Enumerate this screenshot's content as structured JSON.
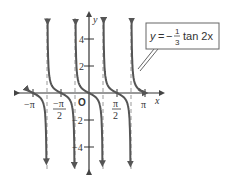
{
  "chart_data": {
    "type": "line",
    "title": "",
    "function_label": {
      "y": "y",
      "eq": "=",
      "minus": "−",
      "num": "1",
      "den": "3",
      "rest": "tan 2x"
    },
    "xlabel": "x",
    "ylabel": "y",
    "origin_label": "O",
    "x_ticks": [
      {
        "value": -3.1416,
        "label": "−π"
      },
      {
        "value": -1.5708,
        "label": "−π/2",
        "num": "−π",
        "den": "2"
      },
      {
        "value": 1.5708,
        "label": "π/2",
        "num": "π",
        "den": "2"
      },
      {
        "value": 3.1416,
        "label": "π"
      }
    ],
    "y_ticks": [
      {
        "value": 4,
        "label": "4"
      },
      {
        "value": 2,
        "label": "2"
      },
      {
        "value": -2,
        "label": "−2"
      },
      {
        "value": -4,
        "label": "−4"
      }
    ],
    "asymptotes": [
      -2.356,
      -0.785,
      0.785,
      2.356
    ],
    "function": "y = -(1/3) tan(2x)",
    "xlim": [
      -3.6,
      3.6
    ],
    "ylim": [
      -5.5,
      5.5
    ],
    "grid": false,
    "colors": {
      "curve": "#555555",
      "axis": "#333333",
      "asymptote": "#999999"
    }
  }
}
